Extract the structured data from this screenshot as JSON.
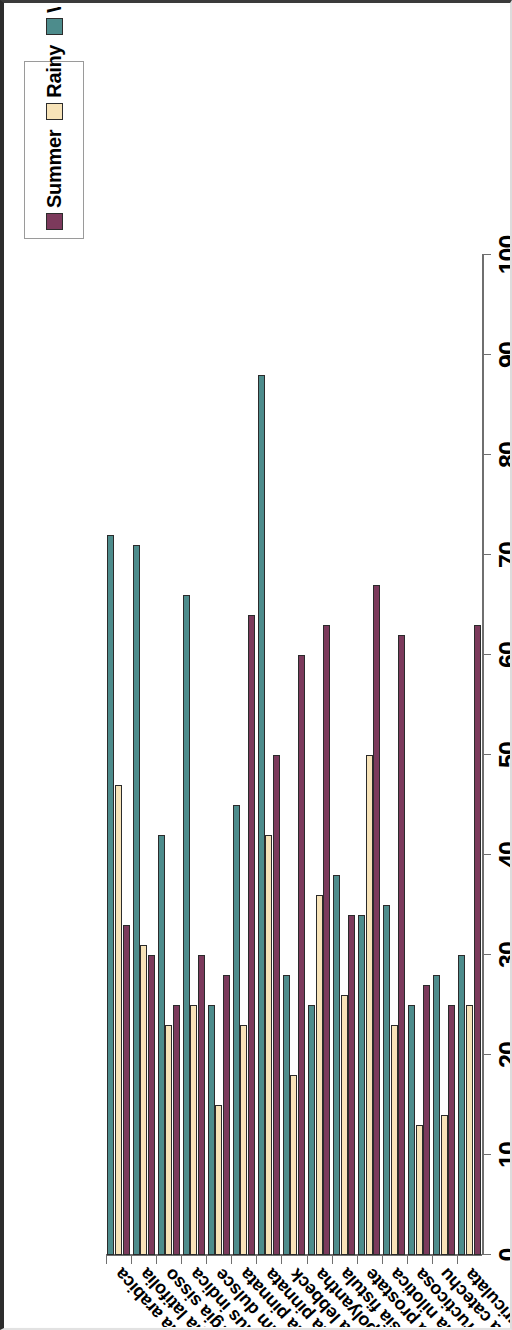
{
  "chart_data": {
    "type": "bar",
    "orientation": "horizontal",
    "title": "",
    "xlabel": "",
    "ylabel": "",
    "ylim": [
      0,
      100
    ],
    "grid": false,
    "legend_position": "top-right",
    "value_ticks": [
      "0",
      "10",
      "20",
      "30",
      "40",
      "50",
      "60",
      "70",
      "80",
      "90",
      "100"
    ],
    "categories": [
      "Cassia auriculata",
      "Acacia catechu",
      "Arbus fructicosa",
      "Acacia nilotica",
      "Crotolaria prostate",
      "Cassia fistula",
      "Acacia polyantha",
      "Albizzia lebbeck",
      "pongamia pinnata",
      "Acacia pinnata",
      "Pithecobillium dulsce",
      "Tamarindus indica",
      "Dalbergia sisso",
      "Dalbergia latifolia",
      "Acacia arabica"
    ],
    "series": [
      {
        "name": "Summer",
        "color": "#7c3a5c",
        "values": [
          63,
          25,
          27,
          62,
          67,
          34,
          63,
          60,
          50,
          64,
          28,
          30,
          25,
          30,
          33
        ]
      },
      {
        "name": "Rainy",
        "color": "#f7e3b8",
        "values": [
          25,
          14,
          13,
          23,
          50,
          26,
          36,
          18,
          42,
          23,
          15,
          25,
          23,
          31,
          47
        ]
      },
      {
        "name": "Winter",
        "color": "#4d8c8c",
        "values": [
          30,
          28,
          25,
          35,
          34,
          38,
          25,
          28,
          88,
          45,
          25,
          66,
          42,
          71,
          72
        ]
      }
    ]
  },
  "legend": {
    "title": "",
    "entries": [
      {
        "label": "Summer",
        "color": "#7c3a5c"
      },
      {
        "label": "Rainy",
        "color": "#f7e3b8"
      },
      {
        "label": "Winter",
        "color": "#4d8c8c"
      }
    ]
  }
}
